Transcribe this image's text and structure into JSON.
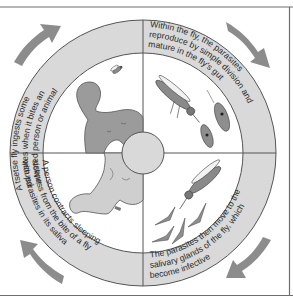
{
  "diagram": {
    "colors": {
      "frame": "#6e6e6e",
      "ring_fill": "#d9d9d9",
      "ring_stroke": "#555555",
      "arrow": "#8c8c8c",
      "person_dark": "#9b9b9b",
      "person_light": "#cfcfcf",
      "center_circle": "#d9d9d9",
      "parasite": "#7a7a7a"
    },
    "stages": [
      {
        "id": "fly-ingests",
        "quadrant": "top-left",
        "lines": [
          "A tsetse fly ingests some",
          "parasites when it bites an",
          "infested person or animal"
        ]
      },
      {
        "id": "reproduce-in-gut",
        "quadrant": "top-right",
        "lines": [
          "Within the fly, the parasites",
          "reproduce by simple division and",
          "mature in the fly's gut"
        ]
      },
      {
        "id": "salivary-glands",
        "quadrant": "bottom-right",
        "lines": [
          "The parasites then move to the",
          "salivary glands of the fly, which",
          "become infective"
        ]
      },
      {
        "id": "person-contracts",
        "quadrant": "bottom-left",
        "lines": [
          "A person contracts sleeping",
          "sickness from the bite of a fly",
          "with parasites in its saliva"
        ]
      }
    ],
    "arrows": [
      {
        "position": "top-left",
        "direction": "clockwise"
      },
      {
        "position": "top-right",
        "direction": "clockwise"
      },
      {
        "position": "bottom-right",
        "direction": "clockwise"
      },
      {
        "position": "bottom-left",
        "direction": "clockwise"
      }
    ],
    "illustrations": [
      {
        "name": "infected-person",
        "quadrant": "top-left"
      },
      {
        "name": "small-tsetse-fly",
        "quadrant": "top-left"
      },
      {
        "name": "tsetse-fly-gut",
        "quadrant": "top-right"
      },
      {
        "name": "trypanosome-cells",
        "quadrant": "top-right"
      },
      {
        "name": "tsetse-fly-biting",
        "quadrant": "bottom-right"
      },
      {
        "name": "trypanosome-parasites",
        "quadrant": "bottom-right"
      },
      {
        "name": "bitten-person",
        "quadrant": "bottom-left"
      }
    ]
  }
}
